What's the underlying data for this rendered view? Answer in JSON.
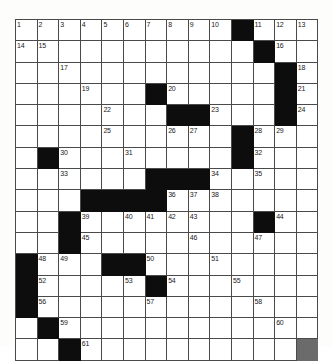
{
  "puzzle": {
    "title": "Crossword Grid",
    "columns": 14,
    "rows": 15,
    "colors": {
      "block": "#0d0d0d",
      "cell": "#ffffff",
      "line": "#4a4a4a",
      "number": "#1a1a1a",
      "paper": "#fdfdfb"
    },
    "grid": [
      [
        {
          "black": false,
          "num": "1"
        },
        {
          "black": false,
          "num": "2"
        },
        {
          "black": false,
          "num": "3"
        },
        {
          "black": false,
          "num": "4"
        },
        {
          "black": false,
          "num": "5"
        },
        {
          "black": false,
          "num": "6"
        },
        {
          "black": false,
          "num": "7"
        },
        {
          "black": false,
          "num": "8"
        },
        {
          "black": false,
          "num": "9"
        },
        {
          "black": false,
          "num": "10"
        },
        {
          "black": true,
          "num": ""
        },
        {
          "black": false,
          "num": "11"
        },
        {
          "black": false,
          "num": "12"
        },
        {
          "black": false,
          "num": "13"
        },
        {
          "black": false,
          "num": "14"
        }
      ],
      [
        {
          "black": false,
          "num": "15"
        },
        {
          "black": false,
          "num": ""
        },
        {
          "black": false,
          "num": ""
        },
        {
          "black": false,
          "num": ""
        },
        {
          "black": false,
          "num": ""
        },
        {
          "black": false,
          "num": ""
        },
        {
          "black": false,
          "num": ""
        },
        {
          "black": false,
          "num": ""
        },
        {
          "black": false,
          "num": ""
        },
        {
          "black": false,
          "num": ""
        },
        {
          "black": true,
          "num": ""
        },
        {
          "black": false,
          "num": "16"
        },
        {
          "black": false,
          "num": ""
        },
        {
          "black": false,
          "num": ""
        },
        {
          "black": false,
          "num": ""
        }
      ],
      [
        {
          "black": false,
          "num": "17"
        },
        {
          "black": false,
          "num": ""
        },
        {
          "black": false,
          "num": ""
        },
        {
          "black": false,
          "num": ""
        },
        {
          "black": false,
          "num": ""
        },
        {
          "black": false,
          "num": ""
        },
        {
          "black": false,
          "num": ""
        },
        {
          "black": false,
          "num": ""
        },
        {
          "black": false,
          "num": ""
        },
        {
          "black": false,
          "num": ""
        },
        {
          "black": true,
          "num": ""
        },
        {
          "black": false,
          "num": "18"
        },
        {
          "black": false,
          "num": ""
        },
        {
          "black": false,
          "num": ""
        },
        {
          "black": false,
          "num": ""
        }
      ],
      [
        {
          "black": false,
          "num": "19"
        },
        {
          "black": false,
          "num": ""
        },
        {
          "black": false,
          "num": ""
        },
        {
          "black": true,
          "num": ""
        },
        {
          "black": false,
          "num": "20"
        },
        {
          "black": false,
          "num": ""
        },
        {
          "black": false,
          "num": ""
        },
        {
          "black": false,
          "num": ""
        },
        {
          "black": false,
          "num": ""
        },
        {
          "black": true,
          "num": ""
        },
        {
          "black": false,
          "num": "21"
        },
        {
          "black": false,
          "num": ""
        },
        {
          "black": false,
          "num": ""
        },
        {
          "black": false,
          "num": ""
        },
        {
          "black": false,
          "num": ""
        }
      ],
      [
        {
          "black": false,
          "num": "22"
        },
        {
          "black": false,
          "num": ""
        },
        {
          "black": false,
          "num": ""
        },
        {
          "black": true,
          "num": ""
        },
        {
          "black": true,
          "num": ""
        },
        {
          "black": false,
          "num": "23"
        },
        {
          "black": false,
          "num": ""
        },
        {
          "black": false,
          "num": ""
        },
        {
          "black": true,
          "num": ""
        },
        {
          "black": false,
          "num": "24"
        },
        {
          "black": false,
          "num": ""
        },
        {
          "black": false,
          "num": ""
        },
        {
          "black": false,
          "num": ""
        },
        {
          "black": false,
          "num": ""
        }
      ],
      [
        {
          "black": false,
          "num": "25"
        },
        {
          "black": false,
          "num": ""
        },
        {
          "black": false,
          "num": ""
        },
        {
          "black": false,
          "num": "26"
        },
        {
          "black": false,
          "num": "27"
        },
        {
          "black": false,
          "num": ""
        },
        {
          "black": true,
          "num": ""
        },
        {
          "black": false,
          "num": "28"
        },
        {
          "black": false,
          "num": "29"
        },
        {
          "black": false,
          "num": ""
        },
        {
          "black": false,
          "num": ""
        },
        {
          "black": true,
          "num": ""
        },
        {
          "black": false,
          "num": "30"
        },
        {
          "black": false,
          "num": ""
        },
        {
          "black": false,
          "num": ""
        }
      ],
      [
        {
          "black": false,
          "num": "31"
        },
        {
          "black": false,
          "num": ""
        },
        {
          "black": false,
          "num": ""
        },
        {
          "black": false,
          "num": ""
        },
        {
          "black": false,
          "num": ""
        },
        {
          "black": true,
          "num": ""
        },
        {
          "black": false,
          "num": "32"
        },
        {
          "black": false,
          "num": ""
        },
        {
          "black": false,
          "num": ""
        },
        {
          "black": false,
          "num": ""
        },
        {
          "black": false,
          "num": ""
        },
        {
          "black": false,
          "num": "33"
        },
        {
          "black": false,
          "num": ""
        },
        {
          "black": false,
          "num": ""
        },
        {
          "black": false,
          "num": ""
        }
      ],
      [
        {
          "black": true,
          "num": ""
        },
        {
          "black": true,
          "num": ""
        },
        {
          "black": true,
          "num": ""
        },
        {
          "black": false,
          "num": "34"
        },
        {
          "black": false,
          "num": ""
        },
        {
          "black": false,
          "num": "35"
        },
        {
          "black": false,
          "num": ""
        },
        {
          "black": false,
          "num": ""
        },
        {
          "black": false,
          "num": ""
        },
        {
          "black": false,
          "num": ""
        },
        {
          "black": false,
          "num": ""
        },
        {
          "black": true,
          "num": ""
        },
        {
          "black": true,
          "num": ""
        },
        {
          "black": true,
          "num": ""
        },
        {
          "black": true,
          "num": ""
        }
      ],
      [
        {
          "black": false,
          "num": "36"
        },
        {
          "black": false,
          "num": "37"
        },
        {
          "black": false,
          "num": "38"
        },
        {
          "black": false,
          "num": ""
        },
        {
          "black": false,
          "num": ""
        },
        {
          "black": false,
          "num": ""
        },
        {
          "black": false,
          "num": ""
        },
        {
          "black": false,
          "num": ""
        },
        {
          "black": false,
          "num": ""
        },
        {
          "black": true,
          "num": ""
        },
        {
          "black": false,
          "num": "39"
        },
        {
          "black": false,
          "num": ""
        },
        {
          "black": false,
          "num": "40"
        },
        {
          "black": false,
          "num": "41"
        },
        {
          "black": false,
          "num": "42"
        }
      ],
      [
        {
          "black": false,
          "num": "43"
        },
        {
          "black": false,
          "num": ""
        },
        {
          "black": false,
          "num": ""
        },
        {
          "black": true,
          "num": ""
        },
        {
          "black": false,
          "num": "44"
        },
        {
          "black": false,
          "num": ""
        },
        {
          "black": false,
          "num": ""
        },
        {
          "black": false,
          "num": ""
        },
        {
          "black": true,
          "num": ""
        },
        {
          "black": false,
          "num": "45"
        },
        {
          "black": false,
          "num": ""
        },
        {
          "black": false,
          "num": ""
        },
        {
          "black": false,
          "num": ""
        },
        {
          "black": false,
          "num": ""
        }
      ],
      [
        {
          "black": false,
          "num": "46"
        },
        {
          "black": false,
          "num": ""
        },
        {
          "black": false,
          "num": ""
        },
        {
          "black": false,
          "num": "47"
        },
        {
          "black": false,
          "num": ""
        },
        {
          "black": false,
          "num": ""
        },
        {
          "black": true,
          "num": ""
        },
        {
          "black": false,
          "num": "48"
        },
        {
          "black": false,
          "num": "49"
        },
        {
          "black": false,
          "num": ""
        },
        {
          "black": true,
          "num": ""
        },
        {
          "black": true,
          "num": ""
        },
        {
          "black": false,
          "num": "50"
        },
        {
          "black": false,
          "num": ""
        },
        {
          "black": false,
          "num": ""
        }
      ],
      [
        {
          "black": false,
          "num": "51"
        },
        {
          "black": false,
          "num": ""
        },
        {
          "black": false,
          "num": ""
        },
        {
          "black": false,
          "num": ""
        },
        {
          "black": false,
          "num": ""
        },
        {
          "black": true,
          "num": ""
        },
        {
          "black": false,
          "num": "52"
        },
        {
          "black": false,
          "num": ""
        },
        {
          "black": false,
          "num": ""
        },
        {
          "black": false,
          "num": ""
        },
        {
          "black": false,
          "num": "53"
        },
        {
          "black": true,
          "num": ""
        },
        {
          "black": false,
          "num": "54"
        },
        {
          "black": false,
          "num": ""
        },
        {
          "black": false,
          "num": ""
        }
      ],
      [
        {
          "black": false,
          "num": "55"
        },
        {
          "black": false,
          "num": ""
        },
        {
          "black": false,
          "num": ""
        },
        {
          "black": false,
          "num": ""
        },
        {
          "black": true,
          "num": ""
        },
        {
          "black": false,
          "num": "56"
        },
        {
          "black": false,
          "num": ""
        },
        {
          "black": false,
          "num": ""
        },
        {
          "black": false,
          "num": ""
        },
        {
          "black": false,
          "num": ""
        },
        {
          "black": false,
          "num": "57"
        },
        {
          "black": false,
          "num": ""
        },
        {
          "black": false,
          "num": ""
        },
        {
          "black": false,
          "num": ""
        },
        {
          "black": false,
          "num": ""
        }
      ],
      [
        {
          "black": false,
          "num": "58"
        },
        {
          "black": false,
          "num": ""
        },
        {
          "black": false,
          "num": ""
        },
        {
          "black": false,
          "num": ""
        },
        {
          "black": true,
          "num": ""
        },
        {
          "black": false,
          "num": "59"
        },
        {
          "black": false,
          "num": ""
        },
        {
          "black": false,
          "num": ""
        },
        {
          "black": false,
          "num": ""
        },
        {
          "black": false,
          "num": ""
        },
        {
          "black": false,
          "num": ""
        },
        {
          "black": false,
          "num": ""
        },
        {
          "black": false,
          "num": ""
        },
        {
          "black": false,
          "num": ""
        },
        {
          "black": false,
          "num": ""
        }
      ],
      [
        {
          "black": false,
          "num": "60"
        },
        {
          "black": false,
          "num": ""
        },
        {
          "black": false,
          "num": ""
        },
        {
          "black": false,
          "num": ""
        },
        {
          "black": true,
          "num": ""
        },
        {
          "black": false,
          "num": "61"
        },
        {
          "black": false,
          "num": ""
        },
        {
          "black": false,
          "num": ""
        },
        {
          "black": false,
          "num": ""
        },
        {
          "black": false,
          "num": ""
        },
        {
          "black": false,
          "num": ""
        },
        {
          "black": false,
          "num": ""
        },
        {
          "black": false,
          "num": ""
        },
        {
          "black": false,
          "num": ""
        },
        {
          "black": false,
          "num": ""
        }
      ]
    ]
  }
}
